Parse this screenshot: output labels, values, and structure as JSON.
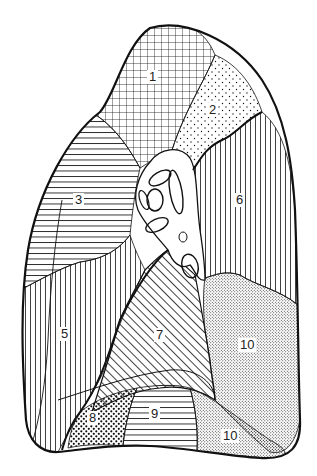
{
  "figure": {
    "colors": {
      "line": "#111111",
      "background": "#ffffff"
    }
  },
  "segments": [
    {
      "id": "1",
      "label": "1",
      "pattern": "grid",
      "x": 151,
      "y": 78
    },
    {
      "id": "2",
      "label": "2",
      "pattern": "sparse-dots",
      "x": 211,
      "y": 110
    },
    {
      "id": "3",
      "label": "3",
      "pattern": "horizontal-lines",
      "x": 77,
      "y": 200
    },
    {
      "id": "6",
      "label": "6",
      "pattern": "vertical-lines",
      "x": 238,
      "y": 200
    },
    {
      "id": "5",
      "label": "5",
      "pattern": "vertical-lines",
      "x": 62,
      "y": 335
    },
    {
      "id": "7",
      "label": "7",
      "pattern": "diagonal-lines",
      "x": 158,
      "y": 335
    },
    {
      "id": "10a",
      "label": "10",
      "pattern": "fine-stipple",
      "x": 244,
      "y": 345
    },
    {
      "id": "8",
      "label": "8",
      "pattern": "coarse-dots",
      "x": 91,
      "y": 418
    },
    {
      "id": "9",
      "label": "9",
      "pattern": "horizontal-lines",
      "x": 152,
      "y": 414
    },
    {
      "id": "10b",
      "label": "10",
      "pattern": "fine-stipple",
      "x": 227,
      "y": 436
    }
  ]
}
